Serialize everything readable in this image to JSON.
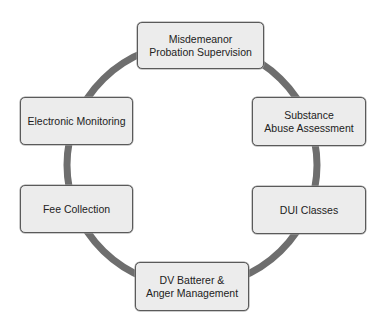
{
  "diagram": {
    "type": "cycle",
    "ring_color": "#6e6e6e",
    "node_fill": "#ececec",
    "node_border": "#5a5a5a",
    "nodes": [
      {
        "id": "top",
        "label": "Misdemeanor\nProbation Supervision"
      },
      {
        "id": "right-top",
        "label": "Substance\nAbuse Assessment"
      },
      {
        "id": "right-bottom",
        "label": "DUI Classes"
      },
      {
        "id": "bottom",
        "label": "DV Batterer &\nAnger Management"
      },
      {
        "id": "left-bottom",
        "label": "Fee Collection"
      },
      {
        "id": "left-top",
        "label": "Electronic Monitoring"
      }
    ]
  }
}
